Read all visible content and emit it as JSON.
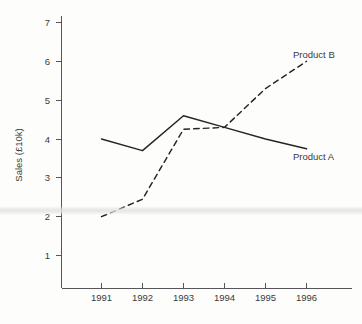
{
  "chart_data": {
    "type": "line",
    "title": "",
    "subtitle": "",
    "xlabel": "",
    "ylabel": "Sales (£10k)",
    "categories": [
      "1991",
      "1992",
      "1993",
      "1994",
      "1995",
      "1996"
    ],
    "x": [
      1991,
      1992,
      1993,
      1994,
      1995,
      1996
    ],
    "xlim": [
      1990.6,
      1996.6
    ],
    "ylim": [
      0,
      7.3
    ],
    "yticks": [
      1,
      2,
      3,
      4,
      5,
      6,
      7
    ],
    "ytick_labels": [
      "1",
      "2",
      "3",
      "4",
      "5",
      "6",
      "7"
    ],
    "xtick_labels": [
      "1991",
      "1992",
      "1993",
      "1994",
      "1995",
      "1996"
    ],
    "grid": false,
    "legend_position": "inline-right-end-labels",
    "series": [
      {
        "name": "Product A",
        "style": "solid",
        "color": "#24242a",
        "values": [
          4.0,
          3.7,
          4.6,
          4.3,
          4.0,
          3.75
        ],
        "label": "Product A"
      },
      {
        "name": "Product B",
        "style": "dashed",
        "color": "#24242a",
        "values": [
          2.0,
          2.45,
          4.25,
          4.3,
          5.3,
          6.0
        ],
        "label": "Product B"
      }
    ],
    "annotations": [
      {
        "text": "Product B",
        "x": 1996.0,
        "y": 6.45
      },
      {
        "text": "Product A",
        "x": 1996.0,
        "y": 3.35
      }
    ]
  },
  "axes": {
    "y_title": "Sales (£10k)",
    "y_ticks": [
      {
        "label": "7",
        "value": 7
      },
      {
        "label": "6",
        "value": 6
      },
      {
        "label": "5",
        "value": 5
      },
      {
        "label": "4",
        "value": 4
      },
      {
        "label": "3",
        "value": 3
      },
      {
        "label": "2",
        "value": 2
      },
      {
        "label": "1",
        "value": 1
      }
    ],
    "x_ticks": [
      {
        "label": "1991",
        "value": 1991
      },
      {
        "label": "1992",
        "value": 1992
      },
      {
        "label": "1993",
        "value": 1993
      },
      {
        "label": "1994",
        "value": 1994
      },
      {
        "label": "1995",
        "value": 1995
      },
      {
        "label": "1996",
        "value": 1996
      }
    ]
  },
  "labels": {
    "product_a": "Product A",
    "product_b": "Product B"
  },
  "colors": {
    "ink": "#24242a",
    "axis": "#56565a",
    "text": "#3a3a3a",
    "background": "#fdfdfc"
  }
}
